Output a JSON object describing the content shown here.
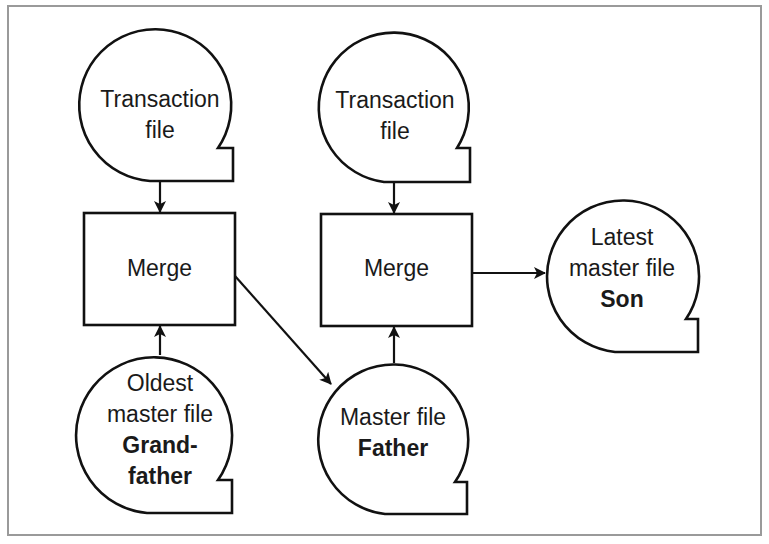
{
  "diagram": {
    "colors": {
      "stroke": "#111111",
      "frame": "#9a9a9a",
      "text": "#1a1a1a",
      "background": "#ffffff"
    },
    "nodes": {
      "transaction_file_1": {
        "type": "tape",
        "lines": [
          "Transaction",
          "file"
        ]
      },
      "merge_1": {
        "type": "process",
        "label": "Merge"
      },
      "grandfather": {
        "type": "tape",
        "lines": [
          "Oldest",
          "master file"
        ],
        "bold_lines": [
          "Grand-",
          "father"
        ]
      },
      "transaction_file_2": {
        "type": "tape",
        "lines": [
          "Transaction",
          "file"
        ]
      },
      "merge_2": {
        "type": "process",
        "label": "Merge"
      },
      "father": {
        "type": "tape",
        "lines": [
          "Master file"
        ],
        "bold_lines": [
          "Father"
        ]
      },
      "son": {
        "type": "tape",
        "lines": [
          "Latest",
          "master file"
        ],
        "bold_lines": [
          "Son"
        ]
      }
    },
    "edges": [
      {
        "from": "transaction_file_1",
        "to": "merge_1"
      },
      {
        "from": "grandfather",
        "to": "merge_1"
      },
      {
        "from": "merge_1",
        "to": "father"
      },
      {
        "from": "transaction_file_2",
        "to": "merge_2"
      },
      {
        "from": "father",
        "to": "merge_2"
      },
      {
        "from": "merge_2",
        "to": "son"
      }
    ]
  }
}
